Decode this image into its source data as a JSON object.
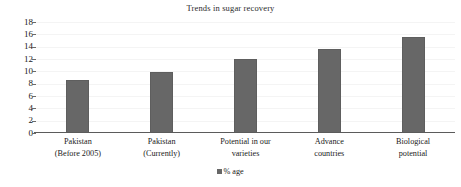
{
  "chart_data": {
    "type": "bar",
    "title": "Trends in sugar recovery",
    "xlabel": "",
    "ylabel": "",
    "ylim": [
      0,
      18
    ],
    "ytick_step": 2,
    "yticks": [
      18,
      16,
      14,
      12,
      10,
      8,
      6,
      4,
      2,
      0
    ],
    "grid": true,
    "legend_position": "bottom",
    "legend": [
      "% age"
    ],
    "categories": [
      "Pakistan\n(Before 2005)",
      "Pakistan\n(Currently)",
      "Potential in our\nvarieties",
      "Advance\ncountries",
      "Biological\npotential"
    ],
    "category_lines": [
      [
        "Pakistan",
        "(Before 2005)"
      ],
      [
        "Pakistan",
        "(Currently)"
      ],
      [
        "Potential in our",
        "varieties"
      ],
      [
        "Advance",
        "countries"
      ],
      [
        "Biological",
        "potential"
      ]
    ],
    "series": [
      {
        "name": "% age",
        "color": "#676767",
        "values": [
          8.6,
          9.9,
          12.0,
          13.6,
          15.6
        ]
      }
    ]
  },
  "colors": {
    "bar": "#676767",
    "gridline": "#f4f4f4",
    "axis": "#5b5b5b",
    "text": "#1a1a1a",
    "background": "#ffffff"
  }
}
